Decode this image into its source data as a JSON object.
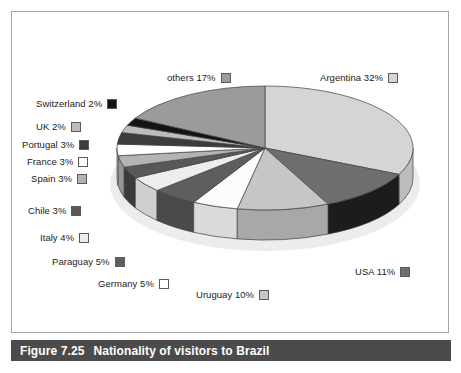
{
  "figure": {
    "caption_number": "Figure 7.25",
    "caption_text": "Nationality of visitors to Brazil",
    "caption_bar_color": "#4b4b4b",
    "frame_color": "#a6a6a6",
    "background_color": "#ffffff"
  },
  "chart_data": {
    "type": "pie",
    "title": "Nationality of visitors to Brazil",
    "xlabel": "",
    "ylabel": "",
    "three_d": true,
    "legend_position": "callout-labels-around-pie",
    "categories": [
      "Argentina",
      "USA",
      "Uruguay",
      "Germany",
      "Paraguay",
      "Italy",
      "Chile",
      "Spain",
      "France",
      "Portugal",
      "UK",
      "Switzerland",
      "others"
    ],
    "values": [
      32,
      11,
      10,
      5,
      5,
      4,
      3,
      3,
      3,
      3,
      2,
      2,
      17
    ],
    "unit": "%",
    "slices": [
      {
        "label": "Argentina",
        "value": 32,
        "value_text": "Argentina 32%",
        "color": "#d5d5d5",
        "side_color": "#bdbdbd"
      },
      {
        "label": "USA",
        "value": 11,
        "value_text": "USA 11%",
        "color": "#6e6e6e",
        "side_color": "#1c1c1c"
      },
      {
        "label": "Uruguay",
        "value": 10,
        "value_text": "Uruguay 10%",
        "color": "#c6c6c6",
        "side_color": "#a8a8a8"
      },
      {
        "label": "Germany",
        "value": 5,
        "value_text": "Germany 5%",
        "color": "#fbfbfb",
        "side_color": "#dadada"
      },
      {
        "label": "Paraguay",
        "value": 5,
        "value_text": "Paraguay 5%",
        "color": "#5e5e5e",
        "side_color": "#4a4a4a"
      },
      {
        "label": "Italy",
        "value": 4,
        "value_text": "Italy 4%",
        "color": "#ededed",
        "side_color": "#cfcfcf"
      },
      {
        "label": "Chile",
        "value": 3,
        "value_text": "Chile 3%",
        "color": "#585858",
        "side_color": "#3b3b3b"
      },
      {
        "label": "Spain",
        "value": 3,
        "value_text": "Spain 3%",
        "color": "#b3b3b3",
        "side_color": "#969696"
      },
      {
        "label": "France",
        "value": 3,
        "value_text": "France 3%",
        "color": "#ffffff",
        "side_color": "#e2e2e2"
      },
      {
        "label": "Portugal",
        "value": 3,
        "value_text": "Portugal 3%",
        "color": "#3c3c3c",
        "side_color": "#2a2a2a"
      },
      {
        "label": "UK",
        "value": 2,
        "value_text": "UK 2%",
        "color": "#bcbcbc",
        "side_color": "#9e9e9e"
      },
      {
        "label": "Switzerland",
        "value": 2,
        "value_text": "Switzerland 2%",
        "color": "#141414",
        "side_color": "#0d0d0d"
      },
      {
        "label": "others",
        "value": 17,
        "value_text": "others 17%",
        "color": "#9b9b9b",
        "side_color": "#858585"
      }
    ]
  },
  "labels": [
    {
      "name": "others",
      "text": "others 17%",
      "swatch": "#9b9b9b",
      "x": 167,
      "y": 73
    },
    {
      "name": "argentina",
      "text": "Argentina 32%",
      "swatch": "#d5d5d5",
      "x": 320,
      "y": 73
    },
    {
      "name": "switzerland",
      "text": "Switzerland 2%",
      "swatch": "#141414",
      "x": 36,
      "y": 99
    },
    {
      "name": "uk",
      "text": "UK 2%",
      "swatch": "#bcbcbc",
      "x": 36,
      "y": 122
    },
    {
      "name": "portugal",
      "text": "Portugal 3%",
      "swatch": "#3c3c3c",
      "x": 22,
      "y": 140
    },
    {
      "name": "france",
      "text": "France 3%",
      "swatch": "#ffffff",
      "x": 27,
      "y": 157
    },
    {
      "name": "spain",
      "text": "Spain 3%",
      "swatch": "#b3b3b3",
      "x": 31,
      "y": 174
    },
    {
      "name": "chile",
      "text": "Chile 3%",
      "swatch": "#585858",
      "x": 28,
      "y": 206
    },
    {
      "name": "italy",
      "text": "Italy 4%",
      "swatch": "#ededed",
      "x": 40,
      "y": 233
    },
    {
      "name": "paraguay",
      "text": "Paraguay 5%",
      "swatch": "#5e5e5e",
      "x": 52,
      "y": 257
    },
    {
      "name": "germany",
      "text": "Germany 5%",
      "swatch": "#ffffff",
      "x": 98,
      "y": 279
    },
    {
      "name": "uruguay",
      "text": "Uruguay 10%",
      "swatch": "#c6c6c6",
      "x": 196,
      "y": 290
    },
    {
      "name": "usa",
      "text": "USA 11%",
      "swatch": "#6e6e6e",
      "x": 355,
      "y": 267
    }
  ]
}
